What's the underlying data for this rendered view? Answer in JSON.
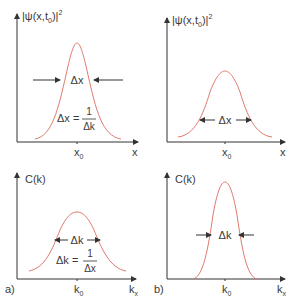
{
  "figure": {
    "curve_color": "#e07a6e",
    "axis_color": "#333333",
    "panels": [
      {
        "id": "a-top",
        "ylabel": "|ψ(x,t",
        "ylabel_sub": "0",
        "ylabel_tail": ")|",
        "ylabel_sup": "2",
        "xlabel": "x",
        "center_label": "x",
        "center_sub": "0",
        "width_label": "Δx",
        "relation_lhs": "Δx =",
        "relation_num": "1",
        "relation_den": "Δk"
      },
      {
        "id": "b-top",
        "ylabel": "|ψ(x,t",
        "ylabel_sub": "0",
        "ylabel_tail": ")|",
        "ylabel_sup": "2",
        "xlabel": "x",
        "center_label": "x",
        "center_sub": "0",
        "width_label": "Δx"
      },
      {
        "id": "a-bottom",
        "ylabel": "C(k)",
        "xlabel": "k",
        "xlabel_sub": "x",
        "center_label": "k",
        "center_sub": "0",
        "width_label": "Δk",
        "relation_lhs": "Δk =",
        "relation_num": "1",
        "relation_den": "Δx",
        "panel_tag": "a)"
      },
      {
        "id": "b-bottom",
        "ylabel": "C(k)",
        "xlabel": "k",
        "xlabel_sub": "x",
        "center_label": "k",
        "center_sub": "0",
        "width_label": "Δk",
        "panel_tag": "b)"
      }
    ]
  }
}
